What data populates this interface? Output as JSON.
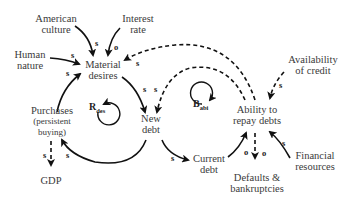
{
  "nodes": {
    "american_culture": [
      "American",
      "culture"
    ],
    "interest_rate": [
      "Interest",
      "rate"
    ],
    "human_nature": [
      "Human",
      "nature"
    ],
    "material_desires": [
      "Material",
      "desires"
    ],
    "availability_of_credit": [
      "Availability",
      "of credit"
    ],
    "purchases": [
      "Purchases",
      "(persistent",
      "buying)"
    ],
    "new_debt": [
      "New",
      "debt"
    ],
    "ability_to_repay": [
      "Ability to",
      "repay debts"
    ],
    "gdp": [
      "GDP"
    ],
    "current_debt": [
      "Current",
      "debt"
    ],
    "financial_resources": [
      "Financial",
      "resources"
    ],
    "defaults": [
      "Defaults &",
      "bankruptcies"
    ]
  },
  "loops": {
    "r_des": {
      "letter": "R",
      "sub": "des"
    },
    "b_abi": {
      "letter": "B",
      "sub": "abi"
    }
  },
  "polarities": {
    "culture_to_desires": "s",
    "interest_to_desires": "o",
    "human_to_desires": "s",
    "ability_to_desires": "s",
    "purchases_to_desires": "s",
    "desires_to_newdebt": "s",
    "ability_to_newdebt": "s",
    "credit_to_ability": "s",
    "newdebt_to_purchases": "s",
    "purchases_to_gdp": "s",
    "newdebt_to_current": "s",
    "current_to_ability": "o",
    "ability_to_defaults": "o",
    "financial_to_ability": "s"
  }
}
